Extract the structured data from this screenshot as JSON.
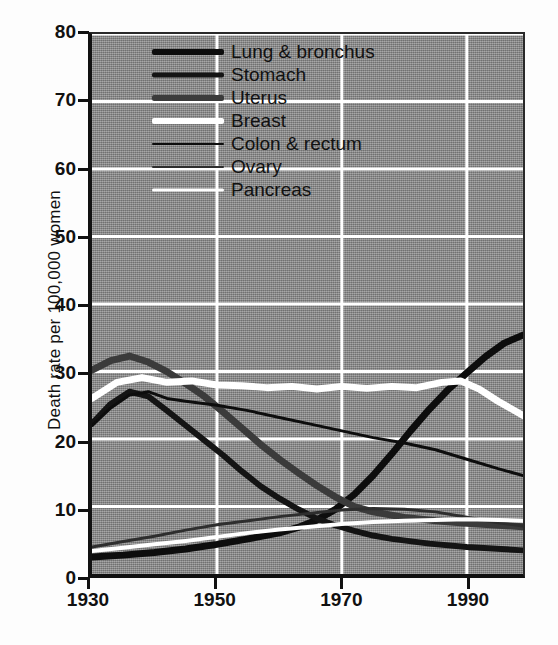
{
  "chart_data": {
    "type": "line",
    "title": "",
    "xlabel": "",
    "ylabel": "Death rate per 100,000 women",
    "xlim": [
      1930,
      1999
    ],
    "ylim": [
      0,
      80
    ],
    "xticks": [
      1930,
      1950,
      1970,
      1990
    ],
    "yticks": [
      0,
      10,
      20,
      30,
      40,
      50,
      60,
      70,
      80
    ],
    "grid": true,
    "grid_color": "#ffffff",
    "plot_background": "#8d8d8d",
    "legend_position": "top-center",
    "series": [
      {
        "name": "Lung & bronchus",
        "color": "#0d0d0d",
        "width": 7,
        "x": [
          1930,
          1935,
          1940,
          1945,
          1950,
          1955,
          1960,
          1963,
          1966,
          1969,
          1972,
          1975,
          1978,
          1981,
          1984,
          1987,
          1990,
          1993,
          1996,
          1999
        ],
        "values": [
          2.5,
          2.8,
          3.2,
          3.7,
          4.4,
          5.2,
          6.1,
          6.9,
          8.0,
          9.6,
          11.8,
          14.6,
          17.8,
          21.2,
          24.4,
          27.3,
          29.8,
          32.2,
          34.2,
          35.4
        ]
      },
      {
        "name": "Stomach",
        "color": "#141414",
        "width": 6,
        "x": [
          1930,
          1933,
          1936,
          1939,
          1942,
          1945,
          1948,
          1951,
          1954,
          1957,
          1960,
          1963,
          1966,
          1969,
          1972,
          1975,
          1978,
          1984,
          1990,
          1999
        ],
        "values": [
          22.3,
          25.2,
          27.0,
          26.3,
          24.2,
          22.0,
          19.8,
          17.6,
          15.2,
          13.0,
          11.2,
          9.6,
          8.2,
          7.2,
          6.4,
          5.7,
          5.2,
          4.5,
          4.0,
          3.5
        ]
      },
      {
        "name": "Uterus",
        "color": "#3b3b3b",
        "width": 7,
        "x": [
          1930,
          1933,
          1936,
          1939,
          1942,
          1945,
          1948,
          1951,
          1954,
          1957,
          1960,
          1963,
          1966,
          1969,
          1972,
          1975,
          1980,
          1985,
          1990,
          1999
        ],
        "values": [
          30.2,
          31.6,
          32.3,
          31.4,
          30.0,
          28.2,
          26.3,
          24.0,
          21.6,
          19.2,
          17.0,
          15.0,
          13.1,
          11.4,
          10.0,
          9.2,
          8.4,
          7.9,
          7.5,
          7.0
        ]
      },
      {
        "name": "Breast",
        "color": "#ffffff",
        "width": 7,
        "x": [
          1930,
          1934,
          1938,
          1942,
          1946,
          1950,
          1954,
          1958,
          1962,
          1966,
          1970,
          1974,
          1978,
          1982,
          1986,
          1989,
          1992,
          1995,
          1999
        ],
        "values": [
          26.0,
          28.4,
          29.1,
          28.4,
          28.6,
          28.0,
          27.9,
          27.6,
          27.8,
          27.4,
          27.8,
          27.5,
          27.8,
          27.6,
          28.4,
          28.6,
          27.4,
          25.6,
          23.5
        ]
      },
      {
        "name": "Colon & rectum",
        "color": "#0d0d0d",
        "width": 3,
        "x": [
          1930,
          1933,
          1936,
          1939,
          1942,
          1945,
          1950,
          1955,
          1960,
          1965,
          1970,
          1975,
          1980,
          1985,
          1990,
          1995,
          1999
        ],
        "values": [
          22.0,
          24.6,
          26.5,
          27.0,
          26.0,
          25.6,
          25.0,
          24.2,
          23.2,
          22.2,
          21.2,
          20.2,
          19.4,
          18.4,
          17.0,
          15.6,
          14.6
        ]
      },
      {
        "name": "Ovary",
        "color": "#2e2e2e",
        "width": 3,
        "x": [
          1930,
          1935,
          1940,
          1945,
          1950,
          1955,
          1960,
          1965,
          1970,
          1975,
          1980,
          1985,
          1990,
          1995,
          1999
        ],
        "values": [
          4.0,
          4.8,
          5.6,
          6.5,
          7.3,
          7.9,
          8.5,
          9.0,
          9.5,
          9.7,
          9.6,
          9.2,
          8.4,
          7.6,
          7.1
        ]
      },
      {
        "name": "Pancreas",
        "color": "#ffffff",
        "width": 4,
        "x": [
          1930,
          1935,
          1940,
          1945,
          1950,
          1955,
          1960,
          1965,
          1970,
          1975,
          1980,
          1985,
          1990,
          1995,
          1999
        ],
        "values": [
          3.4,
          3.9,
          4.4,
          4.9,
          5.5,
          6.1,
          6.6,
          7.0,
          7.4,
          7.7,
          7.9,
          8.0,
          8.1,
          8.0,
          7.9
        ]
      }
    ]
  },
  "legend": {
    "items": [
      {
        "label": "Lung & bronchus",
        "swatch": "legend-line-lung"
      },
      {
        "label": "Stomach",
        "swatch": "legend-line-stomach"
      },
      {
        "label": "Uterus",
        "swatch": "legend-line-uterus"
      },
      {
        "label": "Breast",
        "swatch": "legend-line-breast"
      },
      {
        "label": "Colon & rectum",
        "swatch": "legend-line-colon"
      },
      {
        "label": "Ovary",
        "swatch": "legend-line-ovary"
      },
      {
        "label": "Pancreas",
        "swatch": "legend-line-pancreas"
      }
    ]
  }
}
